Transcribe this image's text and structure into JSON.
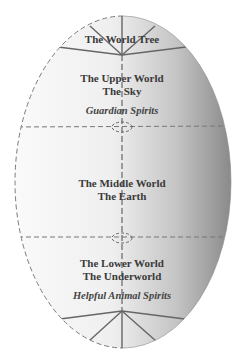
{
  "diagram": {
    "colors": {
      "background": "#ffffff",
      "egg_light": "#f7f7f7",
      "egg_dark": "#8e8e8e",
      "line": "#6a6a6a",
      "dash": "#777777",
      "text": "#3a3a3a"
    },
    "sections": [
      {
        "id": "world-tree",
        "lines": [
          "The World Tree"
        ]
      },
      {
        "id": "upper-world",
        "lines": [
          "The Upper World",
          "The Sky"
        ],
        "spirits": "Guardian Spirits"
      },
      {
        "id": "middle-world",
        "lines": [
          "The Middle World",
          "The Earth"
        ]
      },
      {
        "id": "lower-world",
        "lines": [
          "The Lower World",
          "The Underworld"
        ],
        "spirits": "Helpful Animal Spirits"
      }
    ],
    "portals": [
      "upper-portal",
      "lower-portal"
    ]
  }
}
